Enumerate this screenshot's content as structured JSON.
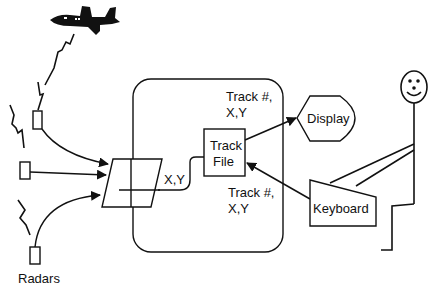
{
  "diagram": {
    "labels": {
      "radars": "Radars",
      "xy_input": "X,Y",
      "track_top_line1": "Track #,",
      "track_top_line2": "X,Y",
      "track_bottom_line1": "Track #,",
      "track_bottom_line2": "X,Y",
      "track_file_line1": "Track",
      "track_file_line2": "File",
      "display": "Display",
      "keyboard": "Keyboard"
    },
    "nodes": [
      "aircraft",
      "radar-1",
      "radar-2",
      "radar-3",
      "input-buffer",
      "system-boundary",
      "track-file",
      "display",
      "keyboard",
      "operator"
    ],
    "edges": [
      {
        "from": "radar-1",
        "to": "input-buffer"
      },
      {
        "from": "radar-2",
        "to": "input-buffer"
      },
      {
        "from": "radar-3",
        "to": "input-buffer"
      },
      {
        "from": "input-buffer",
        "to": "track-file",
        "label": "X,Y"
      },
      {
        "from": "track-file",
        "to": "display",
        "label": "Track #, X,Y"
      },
      {
        "from": "keyboard",
        "to": "track-file",
        "label": "Track #, X,Y"
      }
    ],
    "colors": {
      "stroke": "#111111",
      "background": "#ffffff"
    }
  }
}
